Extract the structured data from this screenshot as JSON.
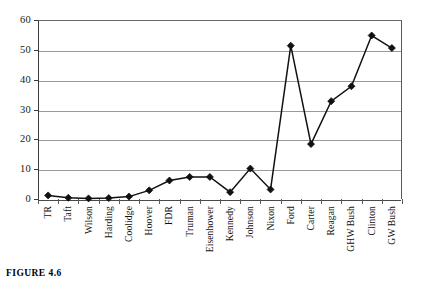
{
  "figure": {
    "caption": "FIGURE 4.6"
  },
  "chart_data": {
    "type": "line",
    "title": "",
    "xlabel": "",
    "ylabel": "",
    "ylim": [
      0,
      60
    ],
    "ytick_labels": [
      "0",
      "10",
      "20",
      "30",
      "40",
      "50",
      "60"
    ],
    "ytick_values": [
      0,
      10,
      20,
      30,
      40,
      50,
      60
    ],
    "grid": true,
    "legend": "none",
    "marker": "diamond",
    "line_color": "#111111",
    "marker_color": "#111111",
    "grid_color": "#9a9a9a",
    "categories": [
      "TR",
      "Taft",
      "Wilson",
      "Harding",
      "Coolidge",
      "Hoover",
      "FDR",
      "Truman",
      "Eisenhower",
      "Kennedy",
      "Johnson",
      "Nixon",
      "Ford",
      "Carter",
      "Reagan",
      "GHW Bush",
      "Clinton",
      "GW Bush"
    ],
    "values": [
      1.2,
      0.4,
      0.2,
      0.3,
      0.8,
      2.9,
      6.2,
      7.4,
      7.4,
      2.3,
      10.2,
      3.2,
      51.4,
      18.4,
      32.8,
      37.8,
      54.8,
      50.6
    ]
  }
}
